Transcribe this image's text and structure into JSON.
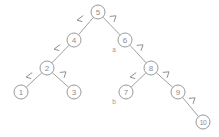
{
  "figure": {
    "background_color": "#ffffff",
    "node_stroke_color": "#9a9a9a",
    "edge_color": "#a0a0a0",
    "text_color": "#8d8d8d",
    "annotation_color": "#9b9b9b"
  },
  "chart_data": {
    "type": "diagram",
    "title": "",
    "nodes": [
      {
        "id": "n5",
        "label": "5",
        "x": 98,
        "y": 12,
        "r": 7
      },
      {
        "id": "n4",
        "label": "4",
        "x": 74,
        "y": 40,
        "r": 7
      },
      {
        "id": "n6",
        "label": "6",
        "x": 125,
        "y": 40,
        "r": 7
      },
      {
        "id": "n2",
        "label": "2",
        "x": 47,
        "y": 68,
        "r": 7
      },
      {
        "id": "n8",
        "label": "8",
        "x": 151,
        "y": 68,
        "r": 7
      },
      {
        "id": "n1",
        "label": "1",
        "x": 21,
        "y": 92,
        "r": 7
      },
      {
        "id": "n3",
        "label": "3",
        "x": 74,
        "y": 92,
        "r": 7
      },
      {
        "id": "n7",
        "label": "7",
        "x": 126,
        "y": 92,
        "r": 7
      },
      {
        "id": "n9",
        "label": "9",
        "x": 178,
        "y": 92,
        "r": 7
      },
      {
        "id": "n10",
        "label": "10",
        "x": 203,
        "y": 122,
        "r": 7
      }
    ],
    "edges": [
      {
        "from": "n5",
        "to": "n4",
        "side": "left"
      },
      {
        "from": "n5",
        "to": "n6",
        "side": "right"
      },
      {
        "from": "n4",
        "to": "n2",
        "side": "left"
      },
      {
        "from": "n6",
        "to": "n8",
        "side": "right"
      },
      {
        "from": "n2",
        "to": "n1",
        "side": "left"
      },
      {
        "from": "n2",
        "to": "n3",
        "side": "right"
      },
      {
        "from": "n8",
        "to": "n7",
        "side": "left"
      },
      {
        "from": "n8",
        "to": "n9",
        "side": "right"
      },
      {
        "from": "n9",
        "to": "n10",
        "side": "right"
      }
    ],
    "edge_markers": [
      {
        "id": "m1",
        "for_edge": "n5-n4",
        "kind": "left-chevron",
        "x": 80,
        "y": 19
      },
      {
        "id": "m2",
        "for_edge": "n5-n6",
        "kind": "right-chevron",
        "x": 113,
        "y": 19
      },
      {
        "id": "m3",
        "for_edge": "n4-n2",
        "kind": "left-chevron",
        "x": 57,
        "y": 48
      },
      {
        "id": "m4",
        "for_edge": "n6-n8",
        "kind": "right-chevron",
        "x": 140,
        "y": 48
      },
      {
        "id": "m5",
        "for_edge": "n2-n1",
        "kind": "left-chevron",
        "x": 29,
        "y": 76
      },
      {
        "id": "m6",
        "for_edge": "n2-n3",
        "kind": "right-chevron",
        "x": 63,
        "y": 75
      },
      {
        "id": "m7",
        "for_edge": "n8-n7",
        "kind": "left-chevron",
        "x": 133,
        "y": 76
      },
      {
        "id": "m8",
        "for_edge": "n8-n9",
        "kind": "right-chevron",
        "x": 166,
        "y": 75
      },
      {
        "id": "m9",
        "for_edge": "n9-n10",
        "kind": "right-chevron",
        "x": 192,
        "y": 101
      }
    ],
    "annotations": [
      {
        "id": "a",
        "label": "a",
        "x": 114,
        "y": 49
      },
      {
        "id": "b",
        "label": "b",
        "x": 114,
        "y": 101
      }
    ]
  }
}
